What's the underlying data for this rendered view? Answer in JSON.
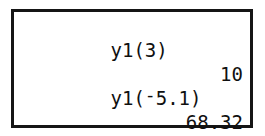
{
  "device": {
    "kind": "graphing-calculator",
    "screen_label": "home-screen"
  },
  "colors": {
    "screen_background": "#ffffff",
    "screen_border": "#151515",
    "text": "#101010",
    "page_background": "#ffffff"
  },
  "screen": {
    "lines": [
      {
        "type": "entry",
        "text": "y1(3)"
      },
      {
        "type": "result",
        "text": "10"
      },
      {
        "type": "entry_negative",
        "prefix": "y1(",
        "negation": "-",
        "value": "5.1)",
        "text": "y1(-5.1)"
      },
      {
        "type": "result",
        "text": "68.32"
      },
      {
        "type": "cursor",
        "text": ""
      }
    ],
    "entry_1": "y1(3)",
    "result_1": "10",
    "entry_2_prefix": "y1(",
    "entry_2_negation": "-",
    "entry_2_value": "5.1)",
    "result_2": "68.32",
    "cursor_glyph": ""
  }
}
